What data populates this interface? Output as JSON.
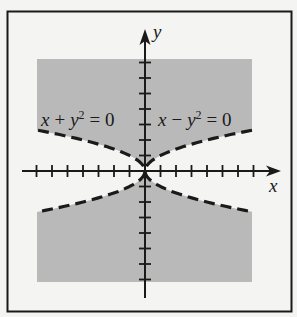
{
  "figure": {
    "x_axis_label": "x",
    "y_axis_label": "y",
    "curves": [
      {
        "label_var": "x",
        "label_op": "+",
        "label_sq": "y",
        "label_exp": "2",
        "label_rhs": "= 0",
        "equation": "x + y^2 = 0",
        "style": "dashed"
      },
      {
        "label_var": "x",
        "label_op": "−",
        "label_sq": "y",
        "label_exp": "2",
        "label_rhs": "= 0",
        "equation": "x - y^2 = 0",
        "style": "dashed"
      }
    ],
    "shading_color": "#b9b9b9",
    "line_color": "#1a1a1a",
    "background_color": "#f4f4f2"
  },
  "chart_data": {
    "type": "region",
    "title": "",
    "xlabel": "x",
    "ylabel": "y",
    "xlim": [
      -7,
      7
    ],
    "ylim": [
      -7,
      7
    ],
    "x_ticks": [
      -7,
      -6,
      -5,
      -4,
      -3,
      -2,
      -1,
      1,
      2,
      3,
      4,
      5,
      6,
      7
    ],
    "y_ticks": [
      -7,
      -6,
      -5,
      -4,
      -3,
      -2,
      -1,
      1,
      2,
      3,
      4,
      5,
      6,
      7
    ],
    "tick_labels_shown": false,
    "curves": [
      {
        "equation": "x + y^2 = 0",
        "x_of_y": "-y^2",
        "style": "dashed",
        "label_position": "upper-left"
      },
      {
        "equation": "x - y^2 = 0",
        "x_of_y": "y^2",
        "style": "dashed",
        "label_position": "upper-right"
      }
    ],
    "shaded_region": "y^2 > |x| (above and below both parabolas), within -7<=x<=7, -7<=y<=7",
    "grid": false
  }
}
